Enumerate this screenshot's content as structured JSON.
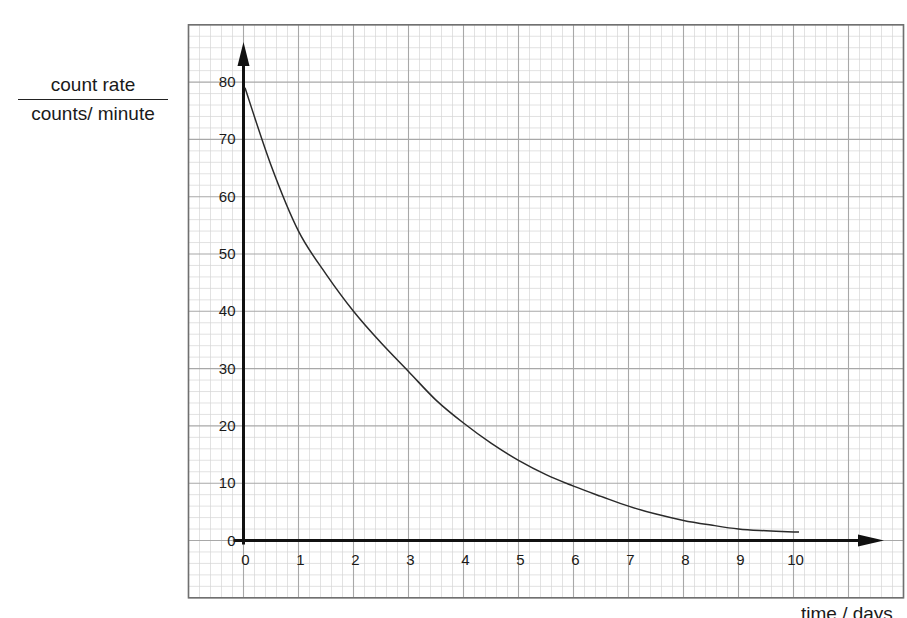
{
  "chart_data": {
    "type": "line",
    "title": "",
    "ylabel": {
      "numerator": "count rate",
      "denominator": "counts/ minute"
    },
    "xlabel": "time / days",
    "x_ticks": [
      "0",
      "1",
      "2",
      "3",
      "4",
      "5",
      "6",
      "7",
      "8",
      "9",
      "10"
    ],
    "y_ticks": [
      "0",
      "10",
      "20",
      "30",
      "40",
      "50",
      "60",
      "70",
      "80"
    ],
    "xlim": [
      -1,
      12
    ],
    "ylim": [
      -10,
      90
    ],
    "grid": {
      "on": true,
      "major_x_step": 1,
      "major_y_step": 10,
      "minor_divisions": 5
    },
    "legend": null,
    "series": [
      {
        "name": "count rate decay curve",
        "x": [
          0,
          0.5,
          1,
          1.5,
          2,
          2.5,
          3,
          3.5,
          4,
          4.5,
          5,
          5.5,
          6,
          6.5,
          7,
          7.5,
          8,
          8.5,
          9,
          9.5,
          10,
          10.1
        ],
        "y": [
          79,
          65.5,
          54,
          46.5,
          40,
          34.5,
          29.5,
          24.5,
          20.5,
          17,
          14,
          11.5,
          9.5,
          7.7,
          6,
          4.6,
          3.5,
          2.7,
          2,
          1.7,
          1.5,
          1.5
        ]
      }
    ],
    "colors": {
      "curve": "#2a2a2a",
      "axis": "#111111",
      "major_grid": "#a8a8a8",
      "minor_grid": "#d6d6d6",
      "border": "#707070"
    }
  }
}
